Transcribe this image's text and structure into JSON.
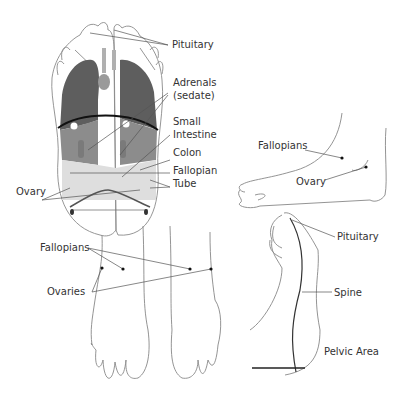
{
  "title": "",
  "sole_view": {
    "labels": {
      "pituitary": "Pituitary",
      "adrenals_1": "Adrenals",
      "adrenals_2": "(sedate)",
      "small_intestine_1": "Small",
      "small_intestine_2": "Intestine",
      "colon": "Colon",
      "fallopian_tube_1": "Fallopian",
      "fallopian_tube_2": "Tube",
      "ovary": "Ovary"
    }
  },
  "side_view": {
    "labels": {
      "fallopians": "Fallopians",
      "ovary": "Ovary"
    }
  },
  "front_view": {
    "labels": {
      "fallopians": "Fallopians",
      "ovaries": "Ovaries"
    }
  },
  "medial_view": {
    "labels": {
      "pituitary": "Pituitary",
      "spine": "Spine",
      "pelvic_area": "Pelvic Area"
    }
  },
  "colors": {
    "outline": "#888888",
    "dark_zone": "#5a5a5a",
    "mid_zone": "#8a8a8a",
    "light_zone": "#d8d8d8",
    "leader": "#555555",
    "dot": "#111111"
  }
}
